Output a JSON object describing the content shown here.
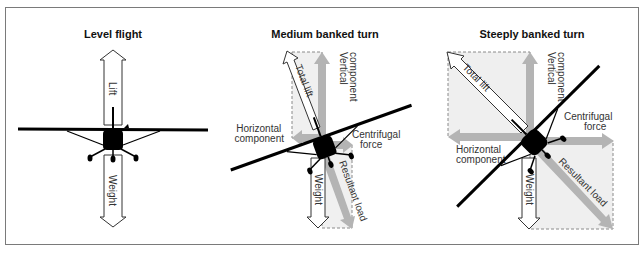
{
  "figure": {
    "panels": [
      {
        "title": "Level flight",
        "labels": {
          "lift": "Lift",
          "weight": "Weight"
        }
      },
      {
        "title": "Medium banked turn",
        "labels": {
          "total_lift": "Total lift",
          "vertical_1": "Vertical",
          "vertical_2": "component",
          "horizontal_1": "Horizontal",
          "horizontal_2": "component",
          "centrifugal_1": "Centrifugal",
          "centrifugal_2": "force",
          "weight": "Weight",
          "resultant": "Resultant load"
        }
      },
      {
        "title": "Steeply banked turn",
        "labels": {
          "total_lift": "Total lift",
          "vertical_1": "Vertical",
          "vertical_2": "component",
          "horizontal_1": "Horizontal",
          "horizontal_2": "component",
          "centrifugal_1": "Centrifugal",
          "centrifugal_2": "force",
          "weight": "Weight",
          "resultant": "Resultant load"
        }
      }
    ],
    "colors": {
      "frame": "#7a7a7a",
      "component_arrow": "#b4b4b4",
      "parallelogram_fill": "#ececec",
      "dash": "#8a8a8a",
      "aircraft": "#000000"
    }
  }
}
